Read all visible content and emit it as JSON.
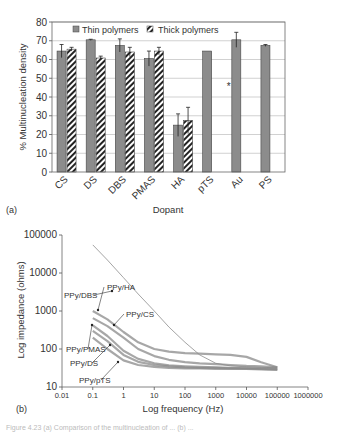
{
  "figure": {
    "panel_a_label": "(a)",
    "panel_b_label": "(b)",
    "caption_partial": "Figure 4.23  (a) Comparison of the multinucleation of ...  (b) ..."
  },
  "chart_data": [
    {
      "type": "bar",
      "title": "",
      "xlabel": "Dopant",
      "ylabel": "% Multinucleation density",
      "ylim": [
        0,
        80
      ],
      "yticks": [
        0,
        10,
        20,
        30,
        40,
        50,
        60,
        70,
        80
      ],
      "grid": true,
      "legend_position": "top-inside",
      "categories": [
        "CS",
        "DS",
        "DBS",
        "PMAS",
        "HA",
        "pTS",
        "Au",
        "PS"
      ],
      "series": [
        {
          "name": "Thin polymers",
          "pattern": "solid-gray",
          "color": "#8c8c8c",
          "values": [
            64.5,
            70.5,
            67.5,
            60.5,
            25,
            64.5,
            70.5,
            67.5
          ],
          "errors": [
            3.5,
            0.3,
            3.5,
            4,
            6,
            0,
            4,
            0.5
          ]
        },
        {
          "name": "Thick polymers",
          "pattern": "diagonal-hatch",
          "color": "#333333",
          "values": [
            65.5,
            60.8,
            64,
            64.5,
            27.5,
            null,
            null,
            null
          ],
          "errors": [
            1,
            1,
            2.5,
            2,
            7,
            null,
            null,
            null
          ]
        }
      ],
      "annotations": [
        {
          "text": "*",
          "category": "pTS",
          "y": 46
        }
      ]
    },
    {
      "type": "line",
      "title": "",
      "xlabel": "Log frequency (Hz)",
      "ylabel": "Log impedance (ohms)",
      "xscale": "log",
      "yscale": "log",
      "xlim": [
        0.01,
        1000000
      ],
      "ylim": [
        10,
        100000
      ],
      "xticks": [
        "0.01",
        "0.1",
        "1",
        "10",
        "100",
        "1000",
        "10000",
        "100000",
        "1000000"
      ],
      "yticks": [
        "10",
        "100",
        "1000",
        "10000",
        "100000"
      ],
      "grid": false,
      "x": [
        0.1,
        0.3,
        1,
        3,
        10,
        30,
        100,
        300,
        1000,
        3000,
        10000,
        30000,
        100000
      ],
      "series": [
        {
          "name": "PPy/DBS",
          "values": [
            55000,
            22000,
            7500,
            2800,
            1000,
            380,
            150,
            70,
            42,
            36,
            34,
            33,
            32
          ]
        },
        {
          "name": "PPy/HA",
          "values": [
            1000,
            600,
            280,
            150,
            100,
            85,
            78,
            75,
            72,
            70,
            62,
            45,
            33
          ]
        },
        {
          "name": "PPy/CS",
          "values": [
            650,
            400,
            200,
            100,
            65,
            52,
            45,
            42,
            40,
            38,
            36,
            35,
            33
          ]
        },
        {
          "name": "PPy/PMAS",
          "values": [
            420,
            220,
            90,
            55,
            42,
            37,
            35,
            34,
            33,
            32,
            31,
            31,
            30
          ]
        },
        {
          "name": "PPy/DS",
          "values": [
            300,
            160,
            70,
            46,
            38,
            35,
            33,
            32,
            32,
            31,
            31,
            30,
            29
          ]
        },
        {
          "name": "PPy/pTS",
          "values": [
            200,
            100,
            50,
            38,
            34,
            32,
            31,
            31,
            30,
            30,
            30,
            29,
            28
          ]
        }
      ],
      "annotations": [
        {
          "text": "PPy/DBS",
          "arrow_to": [
            0.45,
            18000
          ]
        },
        {
          "text": "PPy/HA",
          "arrow_to": [
            0.1,
            1000
          ]
        },
        {
          "text": "PPy/CS",
          "arrow_to": [
            0.4,
            380
          ]
        },
        {
          "text": "PPy/PMAS",
          "arrow_to": [
            0.1,
            420
          ]
        },
        {
          "text": "PPy/DS",
          "arrow_to": [
            0.35,
            100
          ]
        },
        {
          "text": "PPy/pTS",
          "arrow_to": [
            0.45,
            55
          ]
        }
      ]
    }
  ]
}
